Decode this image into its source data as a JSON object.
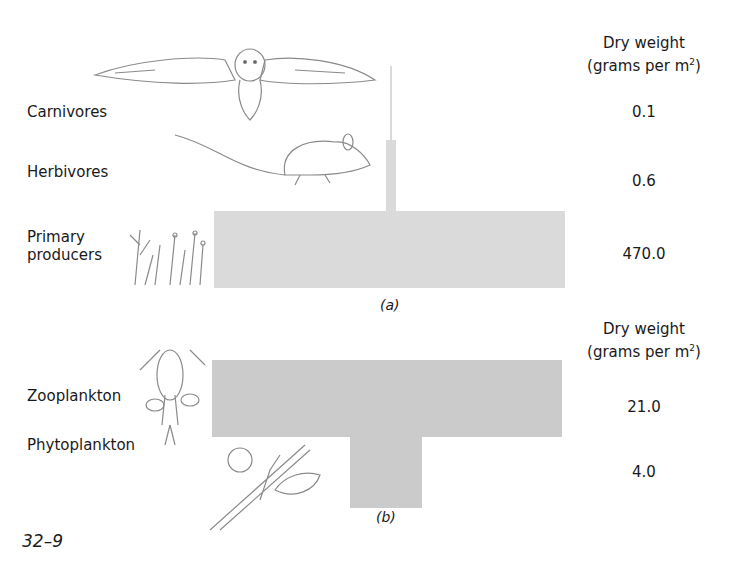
{
  "figure_number": "32–9",
  "panel_a": {
    "caption": "(a)",
    "header_line1": "Dry weight",
    "header_line2": "(grams per m",
    "header_sup": "2",
    "header_close": ")",
    "levels": [
      {
        "name": "Carnivores",
        "value": "0.1",
        "illustration": "owl-illustration"
      },
      {
        "name": "Herbivores",
        "value": "0.6",
        "illustration": "mouse-illustration"
      },
      {
        "name_line1": "Primary",
        "name_line2": "producers",
        "value": "470.0",
        "illustration": "grass-illustration"
      }
    ]
  },
  "panel_b": {
    "caption": "(b)",
    "header_line1": "Dry weight",
    "header_line2": "(grams per m",
    "header_sup": "2",
    "header_close": ")",
    "levels": [
      {
        "name": "Zooplankton",
        "value": "21.0",
        "illustration": "copepod-illustration"
      },
      {
        "name": "Phytoplankton",
        "value": "4.0",
        "illustration": "algae-illustration"
      }
    ]
  },
  "colors": {
    "bar_a": "#dadada",
    "bar_b": "#cbcbcb"
  }
}
